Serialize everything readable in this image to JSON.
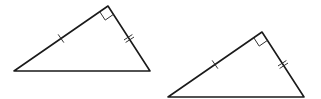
{
  "diagram": {
    "stroke_color": "#1a1a1a",
    "background": "#ffffff",
    "triangles": [
      {
        "id": "triangle-1",
        "vertices": {
          "left": [
            14,
            71
          ],
          "right_angle": [
            108,
            6
          ],
          "right": [
            150,
            71
          ]
        },
        "right_angle_marker": true,
        "long_leg_ticks": 1,
        "short_leg_ticks": 2
      },
      {
        "id": "triangle-2",
        "vertices": {
          "left": [
            168,
            97
          ],
          "right_angle": [
            262,
            32
          ],
          "right": [
            304,
            97
          ]
        },
        "right_angle_marker": true,
        "long_leg_ticks": 1,
        "short_leg_ticks": 2
      }
    ]
  }
}
